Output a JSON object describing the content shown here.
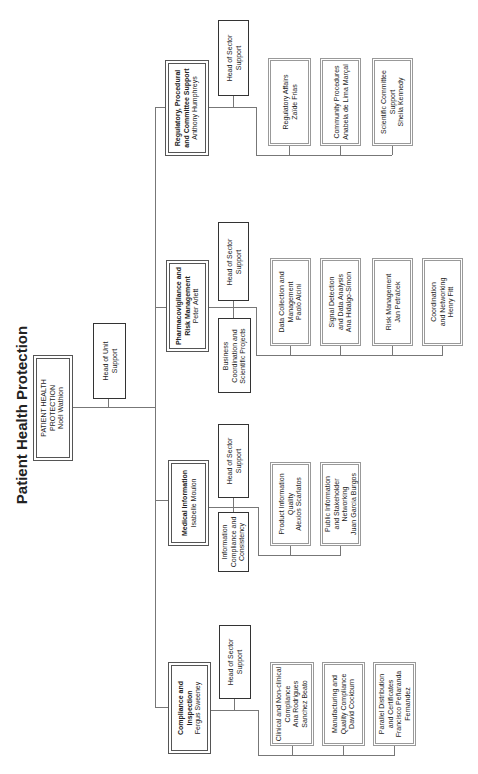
{
  "title": "Patient Health Protection",
  "top": {
    "unit": "PATIENT HEALTH",
    "unit2": "PROTECTION",
    "head": "Noël Wathion",
    "support_line1": "Head of Unit",
    "support_line2": "Support"
  },
  "sectors": [
    {
      "id": "compliance",
      "name_line1": "Compliance and",
      "name_line2": "Inspection",
      "head": "Fergus Sweeney",
      "support_line1": "Head of Sector",
      "support_line2": "Support",
      "children": [
        {
          "lines": [
            "Clinical and Non-clinical",
            "Compliance",
            "Ana Rodrigues",
            "Sanchez Beato"
          ]
        },
        {
          "lines": [
            "Manufacturing and",
            "Quality Compliance",
            "David Cockburn"
          ]
        },
        {
          "lines": [
            "Parallel Distribution",
            "and Certificates",
            "Francisco Peñaranda",
            "Fernandez"
          ]
        }
      ]
    },
    {
      "id": "medical",
      "name_line1": "Medical Information",
      "head": "Isabelle Moulon",
      "support_line1": "Head of Sector",
      "support_line2": "Support",
      "extra_lines": [
        "Information",
        "Compliance and",
        "Consistency"
      ],
      "children": [
        {
          "lines": [
            "Product Information",
            "Quality",
            "Alexios Scarlatos"
          ]
        },
        {
          "lines": [
            "Public Information",
            "and Stakeholder",
            "Networking",
            "Juan Garcia Burgos"
          ]
        }
      ]
    },
    {
      "id": "pharmacovigilance",
      "name_line1": "Pharmacovigilance and",
      "name_line2": "Risk Management",
      "head": "Peter Arlett",
      "support_line1": "Head of Sector",
      "support_line2": "Support",
      "extra_lines": [
        "Business",
        "Coordination and",
        "Scientific Projects"
      ],
      "children": [
        {
          "lines": [
            "Data Collection and",
            "Management",
            "Paolo Alcini"
          ]
        },
        {
          "lines": [
            "Signal Detection",
            "and Data Analysis",
            "Ana Hidalgo-Simon"
          ]
        },
        {
          "lines": [
            "Risk Management",
            "Jan Petráček"
          ]
        },
        {
          "lines": [
            "Coordination",
            "and Networking",
            "Henry Fitt"
          ]
        }
      ]
    },
    {
      "id": "regulatory",
      "name_line1": "Regulatory,  Procedural",
      "name_line2": "and Committee Support",
      "head": "Anthony Humphreys",
      "support_line1": "Head of Sector",
      "support_line2": "Support",
      "children": [
        {
          "lines": [
            "Regulatory Affairs",
            "Zaïde Frias"
          ]
        },
        {
          "lines": [
            "Community Procedures",
            "Anabela de Lima Marçal"
          ]
        },
        {
          "lines": [
            "Scientific Committee",
            "Support",
            "Sheila Kennedy"
          ]
        }
      ]
    }
  ]
}
